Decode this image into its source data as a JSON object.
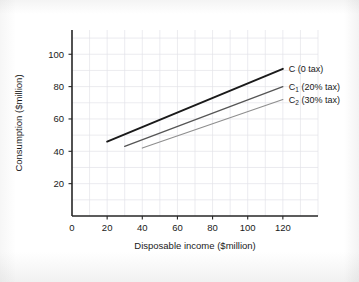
{
  "chart_data": {
    "type": "line",
    "title": "",
    "xlabel": "Disposable income ($million)",
    "ylabel": "Consumption ($million)",
    "xlim": [
      0,
      140
    ],
    "ylim": [
      0,
      115
    ],
    "xticks": [
      0,
      20,
      40,
      60,
      80,
      100,
      120
    ],
    "yticks": [
      20,
      40,
      60,
      80,
      100
    ],
    "xtick_labels": [
      "0",
      "20",
      "40",
      "60",
      "80",
      "100",
      "120"
    ],
    "ytick_labels": [
      "20",
      "40",
      "60",
      "80",
      "100"
    ],
    "grid": true,
    "grid_minor_step": 10,
    "legend_position": "inline-right-of-line-ends",
    "series": [
      {
        "name": "C (0 tax)",
        "label_main": "C",
        "label_sub": "",
        "label_rest": " (0 tax)",
        "color": "#1a1a1a",
        "width": 1.9,
        "x": [
          20,
          120
        ],
        "y": [
          46,
          91
        ]
      },
      {
        "name": "C1 (20% tax)",
        "label_main": "C",
        "label_sub": "1",
        "label_rest": " (20% tax)",
        "color": "#555555",
        "width": 1.3,
        "x": [
          30,
          120
        ],
        "y": [
          43,
          80
        ]
      },
      {
        "name": "C2 (30% tax)",
        "label_main": "C",
        "label_sub": "2",
        "label_rest": " (30% tax)",
        "color": "#8e8e8e",
        "width": 1.1,
        "x": [
          40,
          120
        ],
        "y": [
          42,
          72
        ]
      }
    ]
  },
  "style": {
    "axis_color": "#262626",
    "grid_color": "#e2e2e8",
    "background": "#ffffff",
    "text_color": "#1a1a1a"
  }
}
